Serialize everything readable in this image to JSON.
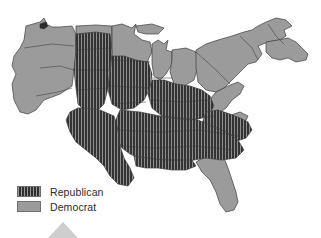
{
  "figure": {
    "type": "choropleth-map",
    "region_scope": "Eastern and central United States"
  },
  "legend": {
    "position": "bottom-left",
    "items": [
      {
        "key": "republican",
        "label": "Republican",
        "color": "#3a3a3a",
        "pattern": "vertical-stripes"
      },
      {
        "key": "democrat",
        "label": "Democrat",
        "color": "#9b9b9b",
        "pattern": "solid"
      }
    ]
  },
  "colors": {
    "republican_fill": "#3a3a3a",
    "republican_stripe": "#9a9a9a",
    "democrat_fill": "#9b9b9b",
    "border": "#3d3d3d",
    "background": "#ffffff",
    "marker_gray": "#c6c6c6"
  },
  "map_data": {
    "type": "map",
    "categories": [
      "Republican",
      "Democrat"
    ],
    "republican_regions": [
      "Great Plains interior",
      "Mississippi Valley",
      "Deep South",
      "Mid-South",
      "Lower Midwest",
      "Appalachian South"
    ],
    "democrat_regions": [
      "Pacific Northwest",
      "Northern Plains",
      "Upper Midwest",
      "Great Lakes",
      "Mid-Atlantic",
      "New England",
      "Florida peninsula"
    ]
  }
}
